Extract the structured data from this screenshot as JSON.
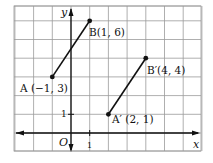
{
  "diagram": {
    "type": "coordinate-grid",
    "axes": {
      "x_label": "x",
      "y_label": "y",
      "origin_label": "O",
      "x_tick": "1",
      "y_tick": "1"
    },
    "grid": {
      "x_min": -3,
      "x_max": 7,
      "y_min": -1,
      "y_max": 7
    },
    "segments": [
      {
        "name": "AB",
        "from": "A",
        "to": "B"
      },
      {
        "name": "A'B'",
        "from": "A'",
        "to": "B'"
      }
    ],
    "points": [
      {
        "id": "A",
        "x": -1,
        "y": 3,
        "label": "A (−1, 3)"
      },
      {
        "id": "B",
        "x": 1,
        "y": 6,
        "label": "B(1, 6)"
      },
      {
        "id": "A'",
        "x": 2,
        "y": 1,
        "label": "A′ (2, 1)"
      },
      {
        "id": "B'",
        "x": 4,
        "y": 4,
        "label": "B′(4, 4)"
      }
    ],
    "colors": {
      "grid": "#9a9a9a",
      "axis": "#111111",
      "segment": "#111111",
      "point": "#111111"
    }
  }
}
